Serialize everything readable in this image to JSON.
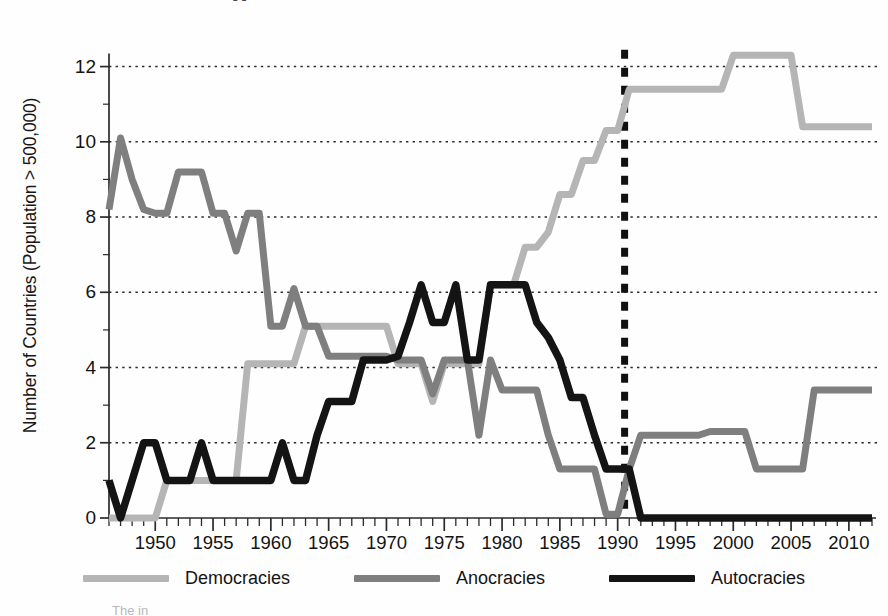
{
  "axes": {
    "ylabel": "Number of Countries (Population > 500,000)",
    "yticks": [
      0,
      2,
      4,
      6,
      8,
      10,
      12
    ],
    "xticks": [
      1950,
      1955,
      1960,
      1965,
      1970,
      1975,
      1980,
      1985,
      1990,
      1995,
      2000,
      2005,
      2010
    ]
  },
  "legend": {
    "items": [
      {
        "label": "Democracies",
        "color": "#b5b5b5"
      },
      {
        "label": "Anocracies",
        "color": "#7f7f7f"
      },
      {
        "label": "Autocracies",
        "color": "#141414"
      }
    ]
  },
  "artifacts": {
    "top": "g",
    "bottom": "The     in    "
  },
  "chart_data": {
    "type": "line",
    "title": "",
    "xlabel": "",
    "ylabel": "Number of Countries (Population > 500,000)",
    "xlim": [
      1946,
      2012
    ],
    "ylim": [
      0,
      12.6
    ],
    "grid": "horizontal-dotted",
    "legend_position": "bottom",
    "annotations": [
      {
        "type": "vline",
        "x": 1990.6,
        "style": "dashed",
        "color": "#111111",
        "width": 7
      }
    ],
    "x": [
      1946,
      1947,
      1948,
      1949,
      1950,
      1951,
      1952,
      1953,
      1954,
      1955,
      1956,
      1957,
      1958,
      1959,
      1960,
      1961,
      1962,
      1963,
      1964,
      1965,
      1966,
      1967,
      1968,
      1969,
      1970,
      1971,
      1972,
      1973,
      1974,
      1975,
      1976,
      1977,
      1978,
      1979,
      1980,
      1981,
      1982,
      1983,
      1984,
      1985,
      1986,
      1987,
      1988,
      1989,
      1990,
      1991,
      1992,
      1993,
      1994,
      1995,
      1996,
      1997,
      1998,
      1999,
      2000,
      2001,
      2002,
      2003,
      2004,
      2005,
      2006,
      2007,
      2008,
      2009,
      2010,
      2011,
      2012
    ],
    "series": [
      {
        "name": "Democracies",
        "color": "#b5b5b5",
        "values": [
          0,
          0,
          0,
          0,
          0,
          1,
          1,
          1,
          1,
          1,
          1,
          1,
          4.1,
          4.1,
          4.1,
          4.1,
          4.1,
          5.1,
          5.1,
          5.1,
          5.1,
          5.1,
          5.1,
          5.1,
          5.1,
          4.1,
          4.1,
          4.1,
          3.1,
          4.1,
          4.1,
          4.1,
          4.1,
          6.2,
          6.2,
          6.2,
          7.2,
          7.2,
          7.6,
          8.6,
          8.6,
          9.5,
          9.5,
          10.3,
          10.3,
          11.4,
          11.4,
          11.4,
          11.4,
          11.4,
          11.4,
          11.4,
          11.4,
          11.4,
          12.3,
          12.3,
          12.3,
          12.3,
          12.3,
          12.3,
          10.4,
          10.4,
          10.4,
          10.4,
          10.4,
          10.4,
          10.4
        ]
      },
      {
        "name": "Anocracies",
        "color": "#7f7f7f",
        "values": [
          8.2,
          10.1,
          9.0,
          8.2,
          8.1,
          8.1,
          9.2,
          9.2,
          9.2,
          8.1,
          8.1,
          7.1,
          8.1,
          8.1,
          5.1,
          5.1,
          6.1,
          5.1,
          5.1,
          4.3,
          4.3,
          4.3,
          4.3,
          4.3,
          4.3,
          4.2,
          4.2,
          4.2,
          3.3,
          4.2,
          4.2,
          4.2,
          2.2,
          4.2,
          3.4,
          3.4,
          3.4,
          3.4,
          2.2,
          1.3,
          1.3,
          1.3,
          1.3,
          0.1,
          0.1,
          1.3,
          2.2,
          2.2,
          2.2,
          2.2,
          2.2,
          2.2,
          2.3,
          2.3,
          2.3,
          2.3,
          1.3,
          1.3,
          1.3,
          1.3,
          1.3,
          3.4,
          3.4,
          3.4,
          3.4,
          3.4,
          3.4
        ]
      },
      {
        "name": "Autocracies",
        "color": "#141414",
        "values": [
          1.0,
          0.0,
          1.0,
          2.0,
          2.0,
          1.0,
          1.0,
          1.0,
          2.0,
          1.0,
          1.0,
          1.0,
          1.0,
          1.0,
          1.0,
          2.0,
          1.0,
          1.0,
          2.2,
          3.1,
          3.1,
          3.1,
          4.2,
          4.2,
          4.2,
          4.3,
          5.2,
          6.2,
          5.2,
          5.2,
          6.2,
          4.2,
          4.2,
          6.2,
          6.2,
          6.2,
          6.2,
          5.2,
          4.8,
          4.2,
          3.2,
          3.2,
          2.2,
          1.3,
          1.3,
          1.3,
          0.0,
          0.0,
          0.0,
          0.0,
          0.0,
          0.0,
          0.0,
          0.0,
          0.0,
          0.0,
          0.0,
          0.0,
          0.0,
          0.0,
          0.0,
          0.0,
          0.0,
          0.0,
          0.0,
          0.0,
          0.0
        ]
      }
    ]
  }
}
